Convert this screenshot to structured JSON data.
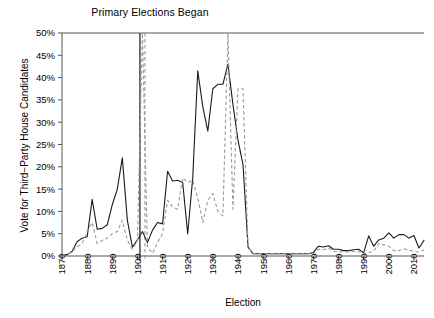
{
  "chart_data": {
    "type": "line",
    "title": "Primary Elections Began",
    "xlabel": "Election",
    "ylabel": "Vote for Third−Party House Candidates",
    "xlim": [
      1870,
      2014
    ],
    "ylim": [
      0,
      50
    ],
    "grid": false,
    "legend": "none",
    "ytick_labels": [
      "0%",
      "5%",
      "10%",
      "15%",
      "20%",
      "25%",
      "30%",
      "35%",
      "40%",
      "45%",
      "50%"
    ],
    "ytick_values": [
      0,
      5,
      10,
      15,
      20,
      25,
      30,
      35,
      40,
      45,
      50
    ],
    "xtick_labels": [
      "1870",
      "1880",
      "1890",
      "1900",
      "1910",
      "1920",
      "1930",
      "1940",
      "1950",
      "1960",
      "1970",
      "1980",
      "1990",
      "2000",
      "2010"
    ],
    "xtick_values": [
      1870,
      1880,
      1890,
      1900,
      1910,
      1920,
      1930,
      1940,
      1950,
      1960,
      1970,
      1980,
      1990,
      2000,
      2010
    ],
    "annotations": [
      {
        "name": "primary-elections-line",
        "type": "vline",
        "x": 1901,
        "style": "solid",
        "color": "#3a3a3a",
        "label": "Primary Elections Began"
      },
      {
        "name": "primary-elections-line-dashed",
        "type": "vline",
        "x": 1903,
        "style": "dashed",
        "color": "#9a9a9a"
      }
    ],
    "x": [
      1870,
      1872,
      1874,
      1876,
      1878,
      1880,
      1882,
      1884,
      1886,
      1888,
      1890,
      1892,
      1894,
      1896,
      1898,
      1900,
      1902,
      1904,
      1906,
      1908,
      1910,
      1912,
      1914,
      1916,
      1918,
      1920,
      1922,
      1924,
      1926,
      1928,
      1930,
      1932,
      1934,
      1936,
      1938,
      1940,
      1942,
      1944,
      1946,
      1948,
      1950,
      1952,
      1954,
      1956,
      1958,
      1960,
      1962,
      1964,
      1966,
      1968,
      1970,
      1972,
      1974,
      1976,
      1978,
      1980,
      1982,
      1984,
      1986,
      1988,
      1990,
      1992,
      1994,
      1996,
      1998,
      2000,
      2002,
      2004,
      2006,
      2008,
      2010,
      2012,
      2014
    ],
    "series": [
      {
        "name": "solid-series",
        "style": "solid",
        "color": "#1a1a1a",
        "values": [
          0.2,
          0.3,
          1.0,
          3.2,
          4.0,
          4.3,
          12.7,
          6.0,
          6.2,
          7.0,
          11.5,
          15.0,
          22.0,
          8.0,
          2.0,
          3.6,
          5.5,
          3.0,
          5.8,
          7.5,
          7.2,
          19.0,
          16.8,
          17.0,
          16.5,
          5.0,
          17.5,
          41.5,
          33.5,
          28.0,
          37.5,
          38.5,
          38.5,
          43.0,
          34.0,
          26.0,
          20.5,
          2.0,
          0.5,
          0.5,
          0.5,
          0.5,
          0.5,
          0.5,
          0.5,
          0.5,
          0.5,
          0.5,
          0.5,
          0.5,
          0.8,
          2.2,
          2.0,
          2.3,
          1.5,
          1.5,
          1.2,
          1.2,
          1.4,
          1.5,
          0.7,
          4.5,
          2.2,
          3.6,
          4.0,
          5.2,
          4.0,
          4.8,
          4.8,
          4.0,
          4.6,
          1.8,
          3.5
        ]
      },
      {
        "name": "dashed-series",
        "style": "dashed",
        "color": "#9a9a9a",
        "values": [
          0.2,
          0.3,
          1.0,
          2.0,
          2.8,
          5.5,
          7.5,
          2.8,
          3.5,
          4.0,
          5.0,
          5.5,
          8.0,
          3.5,
          1.5,
          3.5,
          50.0,
          2.0,
          0.6,
          3.0,
          5.0,
          12.5,
          11.0,
          10.5,
          17.5,
          16.5,
          17.0,
          13.0,
          7.5,
          12.5,
          14.0,
          10.0,
          9.0,
          50.0,
          10.5,
          37.5,
          37.5,
          2.0,
          0.5,
          0.5,
          0.5,
          0.5,
          0.5,
          0.5,
          0.5,
          0.5,
          0.5,
          0.5,
          0.5,
          0.5,
          0.5,
          1.5,
          1.4,
          1.8,
          1.0,
          1.0,
          0.9,
          0.9,
          1.0,
          1.0,
          0.5,
          0.8,
          1.0,
          2.8,
          2.5,
          2.2,
          1.2,
          1.2,
          1.6,
          1.3,
          1.0,
          0.9,
          1.4
        ]
      }
    ]
  }
}
